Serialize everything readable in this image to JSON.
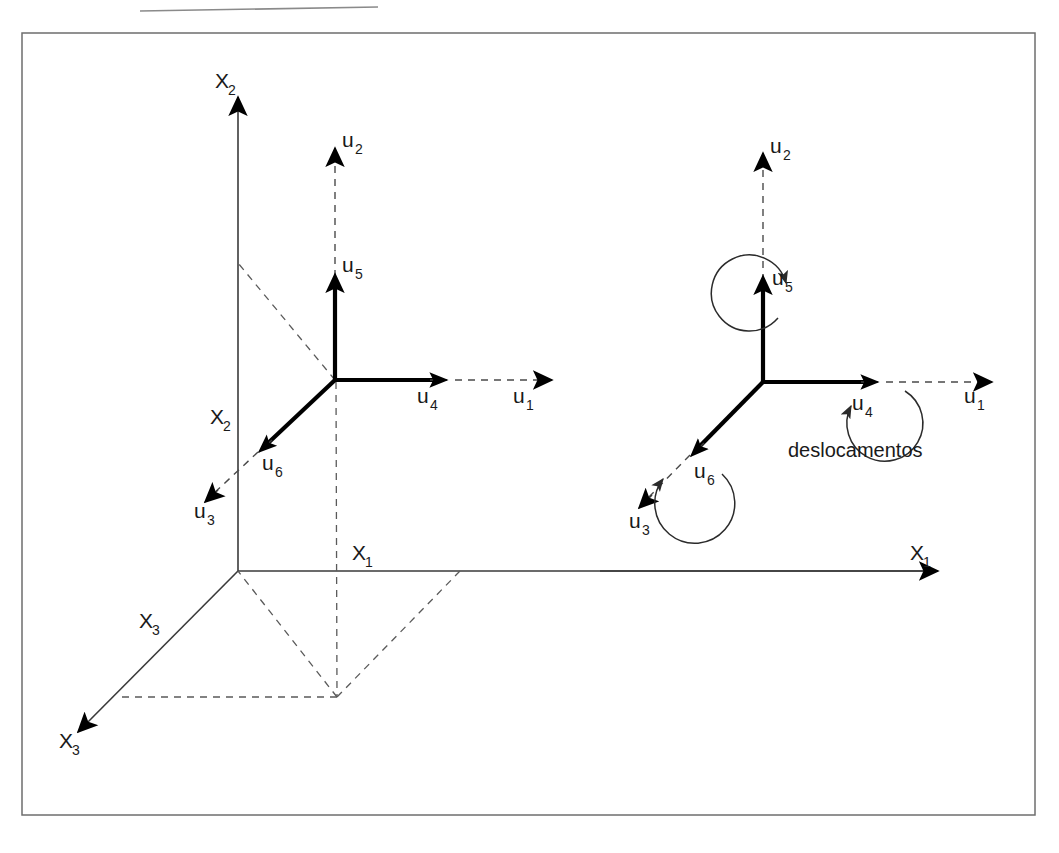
{
  "figure": {
    "caption": "deslocamentos",
    "frame": {
      "x": 22,
      "y": 33,
      "width": 1013,
      "height": 782,
      "border_color": "#6e6e6e"
    },
    "top_rule": {
      "x1": 140,
      "y1": 11,
      "x2": 378,
      "y2": 7,
      "color": "#8a8a8a"
    },
    "background_color": "#ffffff",
    "ink_color": "#000000"
  },
  "left_diagram": {
    "title": "global axes with nodal displacement vectors",
    "node_origin": {
      "x": 335,
      "y": 380
    },
    "global_origin": {
      "x": 238,
      "y": 571
    },
    "axes": [
      {
        "name": "x2-vertical-axis",
        "label": "X",
        "subscript": "2",
        "label_x": 219,
        "label_y": 88,
        "from": {
          "x": 238,
          "y": 571
        },
        "to": {
          "x": 238,
          "y": 88
        }
      },
      {
        "name": "x2-second-label",
        "label": "X",
        "subscript": "2",
        "label_x": 214,
        "label_y": 424
      },
      {
        "name": "x1-horizontal-axis",
        "label": "X",
        "subscript": "1",
        "label_x": 355,
        "label_y": 560,
        "from": {
          "x": 238,
          "y": 571
        },
        "to": {
          "x": 945,
          "y": 571
        }
      },
      {
        "name": "x3-oblique-axis",
        "label": "X",
        "subscript": "3",
        "label_x": 142,
        "label_y": 628,
        "from": {
          "x": 238,
          "y": 571
        },
        "to": {
          "x": 70,
          "y": 740
        }
      },
      {
        "name": "x3-axis-end-label",
        "label": "X",
        "subscript": "3",
        "label_x": 62,
        "label_y": 748
      }
    ],
    "vectors": [
      {
        "name": "u2",
        "label": "u",
        "subscript": "2",
        "label_x": 345,
        "label_y": 147,
        "style": "dashed",
        "tip": {
          "x": 335,
          "y": 140
        },
        "tail": {
          "x": 335,
          "y": 295
        }
      },
      {
        "name": "u5",
        "label": "u",
        "subscript": "5",
        "label_x": 345,
        "label_y": 272,
        "style": "thick-solid",
        "tip": {
          "x": 335,
          "y": 266
        },
        "tail": {
          "x": 335,
          "y": 380
        }
      },
      {
        "name": "u1",
        "label": "u",
        "subscript": "1",
        "label_x": 516,
        "label_y": 403,
        "style": "dashed",
        "tip": {
          "x": 560,
          "y": 380
        },
        "tail": {
          "x": 455,
          "y": 380
        }
      },
      {
        "name": "u4",
        "label": "u",
        "subscript": "4",
        "label_x": 420,
        "label_y": 403,
        "style": "thick-solid",
        "tip": {
          "x": 455,
          "y": 380
        },
        "tail": {
          "x": 335,
          "y": 380
        }
      },
      {
        "name": "u3",
        "label": "u",
        "subscript": "3",
        "label_x": 197,
        "label_y": 518,
        "style": "dashed",
        "tip": {
          "x": 203,
          "y": 490
        },
        "tail": {
          "x": 258,
          "y": 452
        }
      },
      {
        "name": "u6",
        "label": "u",
        "subscript": "6",
        "label_x": 265,
        "label_y": 470,
        "style": "thick-solid",
        "tip": {
          "x": 258,
          "y": 452
        },
        "tail": {
          "x": 335,
          "y": 380
        }
      }
    ],
    "projection_lines": [
      {
        "name": "node-to-x2-axis",
        "from": {
          "x": 335,
          "y": 380
        },
        "to": {
          "x": 238,
          "y": 263
        }
      },
      {
        "name": "node-vertical-drop",
        "from": {
          "x": 335,
          "y": 380
        },
        "to": {
          "x": 337,
          "y": 697
        }
      },
      {
        "name": "foot-to-origin",
        "from": {
          "x": 337,
          "y": 697
        },
        "to": {
          "x": 238,
          "y": 571
        }
      },
      {
        "name": "foot-to-x1",
        "from": {
          "x": 337,
          "y": 697
        },
        "to": {
          "x": 460,
          "y": 571
        }
      },
      {
        "name": "foot-to-x3",
        "from": {
          "x": 337,
          "y": 697
        },
        "to": {
          "x": 120,
          "y": 697
        }
      }
    ]
  },
  "right_diagram": {
    "title": "rotational degrees of freedom",
    "node_origin": {
      "x": 763,
      "y": 382
    },
    "axes": [
      {
        "name": "x1-horizontal-axis",
        "label": "X",
        "subscript": "1",
        "label_x": 913,
        "label_y": 560,
        "from": {
          "x": 600,
          "y": 571
        },
        "to": {
          "x": 945,
          "y": 571
        }
      }
    ],
    "vectors": [
      {
        "name": "u2",
        "label": "u",
        "subscript": "2",
        "label_x": 773,
        "label_y": 153,
        "style": "dashed",
        "tip": {
          "x": 763,
          "y": 145
        },
        "tail": {
          "x": 763,
          "y": 298
        }
      },
      {
        "name": "u5",
        "label": "u",
        "subscript": "5",
        "label_x": 775,
        "label_y": 285,
        "style": "thick-solid",
        "tip": {
          "x": 763,
          "y": 268
        },
        "tail": {
          "x": 763,
          "y": 382
        }
      },
      {
        "name": "u1",
        "label": "u",
        "subscript": "1",
        "label_x": 967,
        "label_y": 403,
        "style": "dashed",
        "tip": {
          "x": 1000,
          "y": 382
        },
        "tail": {
          "x": 886,
          "y": 382
        }
      },
      {
        "name": "u4",
        "label": "u",
        "subscript": "4",
        "label_x": 855,
        "label_y": 410,
        "style": "thick-solid",
        "tip": {
          "x": 886,
          "y": 382
        },
        "tail": {
          "x": 763,
          "y": 382
        }
      },
      {
        "name": "u3",
        "label": "u",
        "subscript": "3",
        "label_x": 632,
        "label_y": 528,
        "style": "dashed",
        "tip": {
          "x": 637,
          "y": 500
        },
        "tail": {
          "x": 690,
          "y": 455
        }
      },
      {
        "name": "u6",
        "label": "u",
        "subscript": "6",
        "label_x": 697,
        "label_y": 478,
        "style": "thick-solid",
        "tip": {
          "x": 690,
          "y": 455
        },
        "tail": {
          "x": 763,
          "y": 382
        }
      }
    ],
    "rotation_arcs": [
      {
        "name": "u5-rotation-arc",
        "center": {
          "x": 763,
          "y": 288
        },
        "radius": 38,
        "meaning": "rotation about u5 axis"
      },
      {
        "name": "u4-rotation-arc",
        "center": {
          "x": 878,
          "y": 378
        },
        "radius": 38,
        "meaning": "rotation about u4 axis"
      },
      {
        "name": "u6-rotation-arc",
        "center": {
          "x": 686,
          "y": 457
        },
        "radius": 40,
        "meaning": "rotation about u6 axis"
      }
    ],
    "caption": {
      "text": "deslocamentos",
      "x": 788,
      "y": 457
    }
  },
  "legend": {
    "solid_meaning": "thick solid segment = local member/displacement component",
    "dashed_meaning": "dashed segment = global direction continuation"
  }
}
